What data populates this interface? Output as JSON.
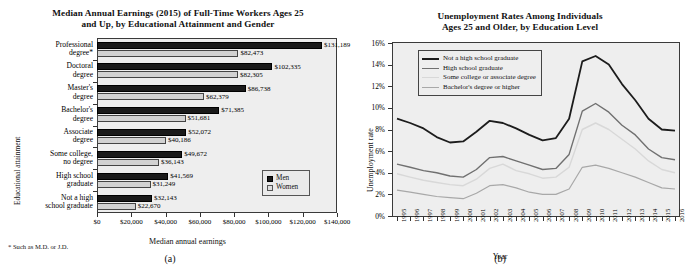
{
  "figure": {
    "panel_a_label": "(a)",
    "panel_b_label": "(b)"
  },
  "panel_a": {
    "title": "Median Annual Earnings (2015) of Full-Time Workers Ages 25 and Up, by Educational Attainment and Gender",
    "title_line1": "Median Annual Earnings (2015) of Full-Time Workers Ages 25",
    "title_line2": "and Up, by Educational Attainment and Gender",
    "xlabel": "Median annual earnings",
    "ylabel": "Educational attainment",
    "footnote": "* Such as M.D. or J.D.",
    "legend": {
      "men": "Men",
      "women": "Women"
    },
    "colors": {
      "men": "#1a1a1a",
      "women": "#d2d2d2",
      "plot_bg": "#eeeeee"
    }
  },
  "panel_b": {
    "title": "Unemployment Rates Among Individuals Ages 25 and Older, by Education Level",
    "title_line1": "Unemployment Rates Among Individuals",
    "title_line2": "Ages 25 and Older, by Education Level",
    "xlabel": "Year",
    "ylabel": "Unemployment rate",
    "colors": {
      "not_hs": "#1c1c1c",
      "hs": "#707070",
      "some_college": "#d8d8d8",
      "bachelors": "#a8a8a8",
      "plot_bg": "#eeeeee"
    }
  },
  "chart_data": [
    {
      "type": "bar",
      "orientation": "horizontal",
      "title": "Median Annual Earnings (2015) of Full-Time Workers Ages 25 and Up, by Educational Attainment and Gender",
      "xlabel": "Median annual earnings",
      "ylabel": "Educational attainment",
      "xlim": [
        0,
        140000
      ],
      "xticks": [
        0,
        20000,
        40000,
        60000,
        80000,
        100000,
        120000,
        140000
      ],
      "xticklabels": [
        "$0",
        "$20,000",
        "$40,000",
        "$60,000",
        "$80,000",
        "$100,000",
        "$120,000",
        "$140,000"
      ],
      "grid": false,
      "legend_position": "lower right",
      "categories": [
        "Professional degree*",
        "Doctoral degree",
        "Master's degree",
        "Bachelor's degree",
        "Associate degree",
        "Some college, no degree",
        "High school graduate",
        "Not a high school graduate"
      ],
      "category_lines": [
        [
          "Professional",
          "degree*"
        ],
        [
          "Doctoral",
          "degree"
        ],
        [
          "Master's",
          "degree"
        ],
        [
          "Bachelor's",
          "degree"
        ],
        [
          "Associate",
          "degree"
        ],
        [
          "Some college,",
          "no degree"
        ],
        [
          "High school",
          "graduate"
        ],
        [
          "Not a high",
          "school graduate"
        ]
      ],
      "series": [
        {
          "name": "Men",
          "values": [
            131189,
            102335,
            86738,
            71385,
            52072,
            49672,
            41569,
            32143
          ],
          "labels": [
            "$131,189",
            "$102,335",
            "$86,738",
            "$71,385",
            "$52,072",
            "$49,672",
            "$41,569",
            "$32,143"
          ]
        },
        {
          "name": "Women",
          "values": [
            82473,
            82305,
            62379,
            51681,
            40186,
            36143,
            31249,
            22670
          ],
          "labels": [
            "$82,473",
            "$82,305",
            "$62,379",
            "$51,681",
            "$40,186",
            "$36,143",
            "$31,249",
            "$22,670"
          ]
        }
      ]
    },
    {
      "type": "line",
      "title": "Unemployment Rates Among Individuals Ages 25 and Older, by Education Level",
      "xlabel": "Year",
      "ylabel": "Unemployment rate",
      "ylim": [
        0,
        16
      ],
      "yticks": [
        0,
        2,
        4,
        6,
        8,
        10,
        12,
        14,
        16
      ],
      "yticklabels": [
        "0%",
        "2%",
        "4%",
        "6%",
        "8%",
        "10%",
        "12%",
        "14%",
        "16%"
      ],
      "grid": false,
      "legend_position": "upper left",
      "x": [
        1995,
        1996,
        1997,
        1998,
        1999,
        2000,
        2001,
        2002,
        2003,
        2004,
        2005,
        2006,
        2007,
        2008,
        2009,
        2010,
        2011,
        2012,
        2013,
        2014,
        2015,
        2016
      ],
      "xticklabels": [
        "1995",
        "1996",
        "1997",
        "1998",
        "1999",
        "2000",
        "2001",
        "2002",
        "2003",
        "2004",
        "2005",
        "2006",
        "2007",
        "2008",
        "2009",
        "2010",
        "2011",
        "2012",
        "2013",
        "2014",
        "2015",
        "2016"
      ],
      "series": [
        {
          "name": "Not a high school graduate",
          "color": "#1c1c1c",
          "values": [
            9.0,
            8.6,
            8.1,
            7.3,
            6.8,
            6.9,
            7.8,
            8.8,
            8.6,
            8.1,
            7.5,
            7.0,
            7.2,
            9.0,
            14.3,
            14.8,
            14.0,
            12.2,
            10.7,
            9.0,
            8.0,
            7.9
          ]
        },
        {
          "name": "High school graduate",
          "color": "#707070",
          "values": [
            4.8,
            4.5,
            4.2,
            4.0,
            3.7,
            3.6,
            4.3,
            5.4,
            5.5,
            5.1,
            4.7,
            4.3,
            4.4,
            5.7,
            9.7,
            10.4,
            9.6,
            8.4,
            7.5,
            6.2,
            5.4,
            5.2
          ]
        },
        {
          "name": "Some college or associate degree",
          "color": "#d8d8d8",
          "values": [
            3.9,
            3.6,
            3.3,
            3.1,
            2.9,
            2.8,
            3.4,
            4.4,
            4.8,
            4.2,
            3.9,
            3.5,
            3.6,
            4.5,
            8.0,
            8.6,
            8.0,
            7.1,
            6.2,
            5.1,
            4.3,
            4.0
          ]
        },
        {
          "name": "Bachelor's degree or higher",
          "color": "#a8a8a8",
          "values": [
            2.4,
            2.2,
            2.0,
            1.8,
            1.7,
            1.6,
            2.1,
            2.8,
            2.9,
            2.6,
            2.2,
            2.0,
            2.0,
            2.5,
            4.5,
            4.7,
            4.4,
            4.0,
            3.6,
            3.1,
            2.6,
            2.5
          ]
        }
      ]
    }
  ]
}
